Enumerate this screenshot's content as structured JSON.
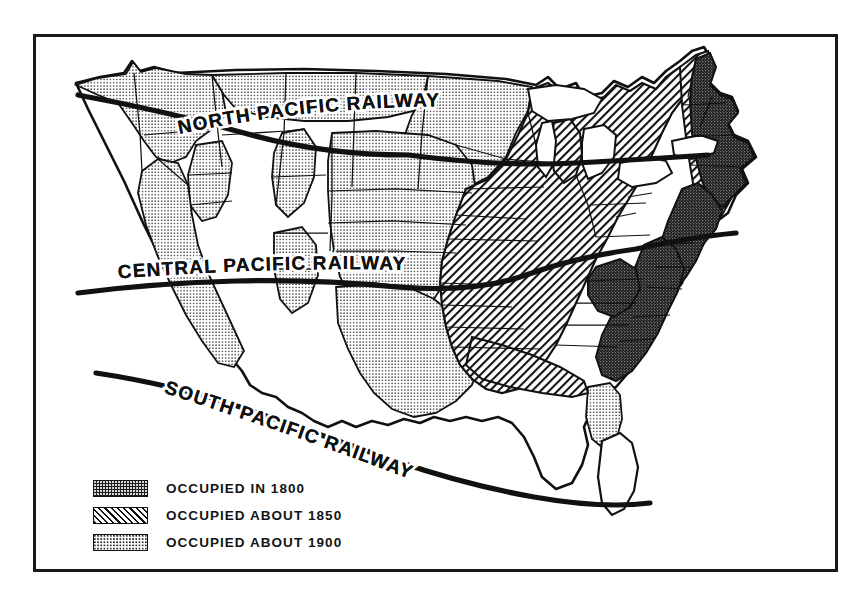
{
  "figure": {
    "kind": "historical-thematic-map",
    "frame_border_color": "#1a1a1a",
    "background_color": "#ffffff"
  },
  "map": {
    "railways": [
      {
        "id": "north",
        "label": "NORTH PACIFIC RAILWAY"
      },
      {
        "id": "central",
        "label": "CENTRAL PACIFIC RAILWAY"
      },
      {
        "id": "south",
        "label": "SOUTH PACIFIC RAILWAY"
      }
    ],
    "line_color": "#111111",
    "water_color": "#ffffff"
  },
  "legend": {
    "items": [
      {
        "key": "1800",
        "pattern": "dark-stipple",
        "label": "OCCUPIED IN 1800",
        "color": "#1d1d1d"
      },
      {
        "key": "1850",
        "pattern": "diagonal-hatch",
        "label": "OCCUPIED ABOUT 1850",
        "color": "#111111"
      },
      {
        "key": "1900",
        "pattern": "light-stipple",
        "label": "OCCUPIED ABOUT 1900",
        "color": "#2a2a2a"
      }
    ]
  }
}
